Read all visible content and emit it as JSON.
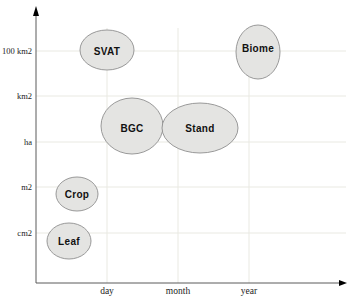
{
  "chart_data": {
    "type": "bubble",
    "title": "",
    "xlabel": "",
    "ylabel": "",
    "grid": true,
    "legend": "none",
    "x_axis": {
      "ticks": [
        "day",
        "month",
        "year"
      ],
      "tick_px": [
        107,
        178,
        249
      ],
      "axis_y_px": 283,
      "start_x_px": 36,
      "end_x_px": 339,
      "arrow_tip_x_px": 347
    },
    "y_axis": {
      "ticks": [
        "cm2",
        "m2",
        "ha",
        "km2",
        "100 km2"
      ],
      "tick_px": [
        233,
        187,
        142,
        96,
        51
      ],
      "axis_x_px": 36,
      "top_y_px": 16,
      "arrow_tip_y_px": 6,
      "grid_right_px": 346,
      "vgrid_top_px": 28
    },
    "bubbles": [
      {
        "label": "SVAT",
        "x": "day",
        "y": "100 km2",
        "cx": 107,
        "cy": 50,
        "rx": 27,
        "ry": 20,
        "label_dy": 1
      },
      {
        "label": "Biome",
        "x": "year",
        "y": "100 km2",
        "cx": 258,
        "cy": 52,
        "rx": 22,
        "ry": 27,
        "label_dy": -4
      },
      {
        "label": "BGC",
        "x": "day to month",
        "y": "ha to km2",
        "cx": 132,
        "cy": 126,
        "rx": 31,
        "ry": 28,
        "label_dy": 2
      },
      {
        "label": "Stand",
        "x": "month",
        "y": "ha to km2",
        "cx": 200,
        "cy": 128,
        "rx": 38,
        "ry": 25,
        "label_dy": 0
      },
      {
        "label": "Crop",
        "x": "below day",
        "y": "m2",
        "cx": 77,
        "cy": 194,
        "rx": 21,
        "ry": 17,
        "label_dy": 0
      },
      {
        "label": "Leaf",
        "x": "below day",
        "y": "cm2",
        "cx": 69,
        "cy": 241,
        "rx": 22,
        "ry": 18,
        "label_dy": 0
      }
    ],
    "colors": {
      "background": "#ffffff",
      "bubble_fill": "#e4e4e2",
      "bubble_stroke": "#8f8f8f",
      "grid": "#e9e9e2",
      "axis": "#5a5a5a",
      "arrow": "#000000",
      "text": "#1c1c1c"
    }
  }
}
